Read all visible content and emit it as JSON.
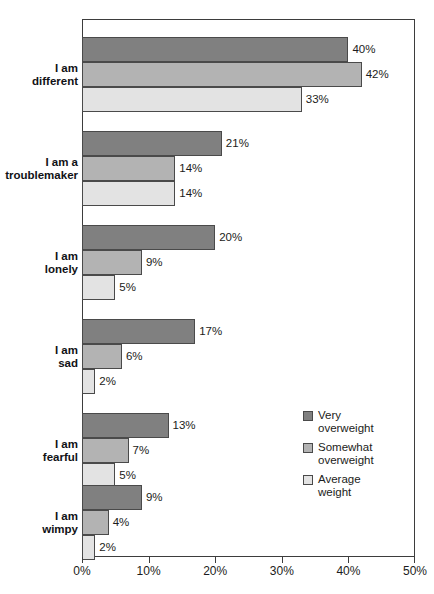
{
  "chart_data": {
    "type": "bar",
    "orientation": "horizontal",
    "title": "",
    "xlabel": "",
    "ylabel": "",
    "xlim": [
      0,
      50
    ],
    "xtick_labels": [
      "0%",
      "10%",
      "20%",
      "30%",
      "40%",
      "50%"
    ],
    "xtick_values": [
      0,
      10,
      20,
      30,
      40,
      50
    ],
    "grid": false,
    "legend_position": "inside-right-lower",
    "value_label_suffix": "%",
    "categories": [
      "I am\ndifferent",
      "I am a\ntroublemaker",
      "I am\nlonely",
      "I am\nsad",
      "I am\nfearful",
      "I am\nwimpy"
    ],
    "series": [
      {
        "name": "Very\noverweight",
        "legend_label": "Very overweight",
        "color": "#808080",
        "values": [
          40,
          21,
          20,
          17,
          13,
          9
        ],
        "value_labels": [
          "40%",
          "21%",
          "20%",
          "17%",
          "13%",
          "9%"
        ]
      },
      {
        "name": "Somewhat\noverweight",
        "legend_label": "Somewhat overweight",
        "color": "#b3b3b3",
        "values": [
          42,
          14,
          9,
          6,
          7,
          4
        ],
        "value_labels": [
          "42%",
          "14%",
          "9%",
          "6%",
          "7%",
          "4%"
        ]
      },
      {
        "name": "Average\nweight",
        "legend_label": "Average weight",
        "color": "#e3e3e3",
        "values": [
          33,
          14,
          5,
          2,
          5,
          2
        ],
        "value_labels": [
          "33%",
          "14%",
          "5%",
          "2%",
          "5%",
          "2%"
        ]
      }
    ]
  },
  "legend": {
    "items": [
      {
        "line1": "Very",
        "line2": "overweight"
      },
      {
        "line1": "Somewhat",
        "line2": "overweight"
      },
      {
        "line1": "Average",
        "line2": "weight"
      }
    ]
  },
  "colors": {
    "series_very_overweight": "#808080",
    "series_somewhat_overweight": "#b3b3b3",
    "series_average_weight": "#e3e3e3",
    "axis": "#3d3d3d",
    "text": "#1b1c20",
    "background": "#ffffff"
  }
}
